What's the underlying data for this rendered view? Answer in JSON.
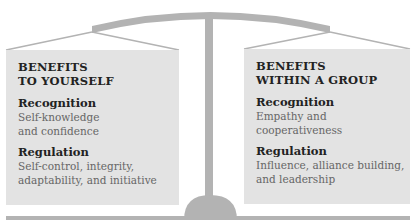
{
  "colors": {
    "panel_bg": "#e3e3e3",
    "scale_gray": "#b3b3b3",
    "heading": "#222222",
    "body_text": "#666666"
  },
  "left_panel": {
    "title_line1": "BENEFITS",
    "title_line2": "TO YOURSELF",
    "sections": [
      {
        "heading": "Recognition",
        "lines": [
          "Self-knowledge",
          "and confidence"
        ]
      },
      {
        "heading": "Regulation",
        "lines": [
          "Self-control, integrity,",
          "adaptability, and initiative"
        ]
      }
    ]
  },
  "right_panel": {
    "title_line1": "BENEFITS",
    "title_line2": "WITHIN A GROUP",
    "sections": [
      {
        "heading": "Recognition",
        "lines": [
          "Empathy and",
          "cooperativeness"
        ]
      },
      {
        "heading": "Regulation",
        "lines": [
          "Influence, alliance building,",
          "and leadership"
        ]
      }
    ]
  }
}
